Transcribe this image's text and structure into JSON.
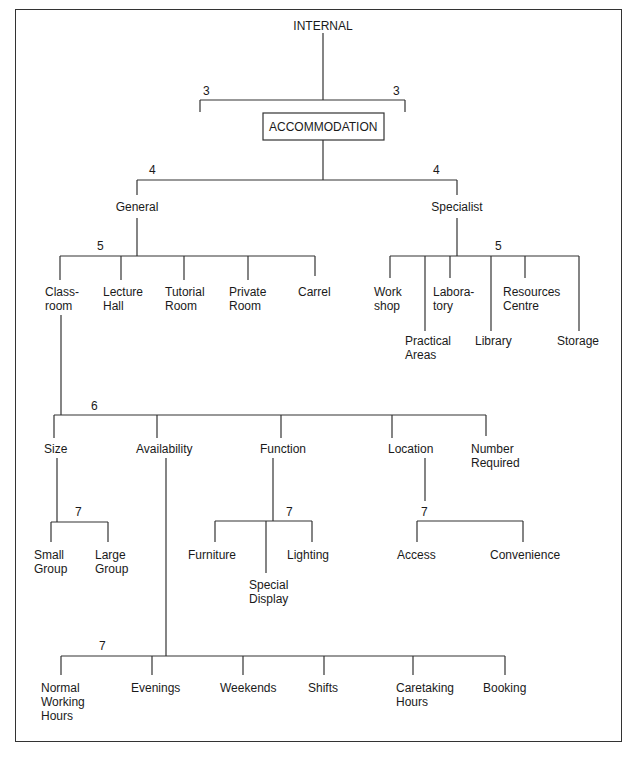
{
  "diagram": {
    "root": "INTERNAL",
    "root_levels": [
      "3",
      "3"
    ],
    "main": "ACCOMMODATION",
    "level4": {
      "numbers": [
        "4",
        "4"
      ],
      "general": "General",
      "specialist": "Specialist"
    },
    "general_children": {
      "level": "5",
      "items": [
        "Class-\nroom",
        "Lecture\nHall",
        "Tutorial\nRoom",
        "Private\nRoom",
        "Carrel"
      ]
    },
    "specialist_children": {
      "level": "5",
      "items": [
        "Work\nshop",
        "Practical\nAreas",
        "Labora-\ntory",
        "Library",
        "Resources\nCentre",
        "Storage"
      ]
    },
    "classroom_children": {
      "level": "6",
      "items": [
        "Size",
        "Availability",
        "Function",
        "Location",
        "Number\nRequired"
      ]
    },
    "size_children": {
      "level": "7",
      "items": [
        "Small\nGroup",
        "Large\nGroup"
      ]
    },
    "function_children": {
      "level": "7",
      "items": [
        "Furniture",
        "Special\nDisplay",
        "Lighting"
      ]
    },
    "location_children": {
      "level": "7",
      "items": [
        "Access",
        "Convenience"
      ]
    },
    "availability_children": {
      "level": "7",
      "items": [
        "Normal\nWorking\nHours",
        "Evenings",
        "Weekends",
        "Shifts",
        "Caretaking\nHours",
        "Booking"
      ]
    }
  }
}
